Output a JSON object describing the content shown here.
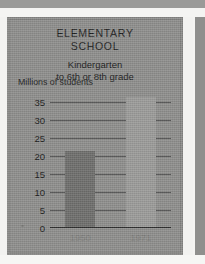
{
  "page": {
    "background_color": "#8e8e8c",
    "paper_color": "#f4f4f2"
  },
  "chart_data": {
    "type": "bar",
    "title": "ELEMENTARY SCHOOL",
    "title_lines": [
      "ELEMENTARY",
      "SCHOOL"
    ],
    "subtitle": "Kindergarten to 6th or 8th grade",
    "subtitle_lines": [
      "Kindergarten",
      "to 6th or 8th grade"
    ],
    "ylabel": "Millions of students",
    "xlabel": "",
    "categories": [
      "1950",
      "1971"
    ],
    "values": [
      21,
      36
    ],
    "series": [
      {
        "name": "Millions of students",
        "values": [
          21,
          36
        ]
      }
    ],
    "ylim": [
      0,
      37.5
    ],
    "yticks": [
      35,
      30,
      25,
      20,
      15,
      10,
      5,
      0
    ],
    "ytick_labels": [
      "35",
      "30",
      "25",
      "20",
      "15",
      "10",
      "5",
      "0"
    ],
    "grid": true,
    "legend": "none",
    "bar_colors": [
      "#6e6e6c",
      "#9b9b99"
    ]
  }
}
